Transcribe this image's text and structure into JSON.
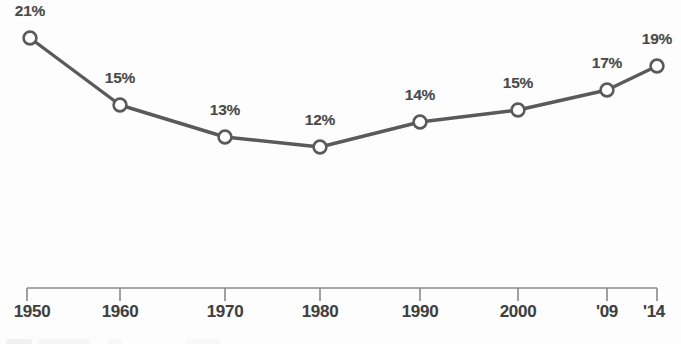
{
  "chart_data": {
    "type": "line",
    "title": "",
    "subtitle": "",
    "xlabel": "",
    "ylabel": "",
    "grid": false,
    "legend": "none",
    "series_name": "Percent",
    "categories": [
      "1950",
      "1960",
      "1970",
      "1980",
      "1990",
      "2000",
      "'09",
      "'14"
    ],
    "values": [
      21,
      15,
      13,
      12,
      14,
      15,
      17,
      19
    ],
    "value_labels": [
      "21%",
      "15%",
      "13%",
      "12%",
      "14%",
      "15%",
      "17%",
      "19%"
    ],
    "tick_labels": [
      "1950",
      "1960",
      "1970",
      "1980",
      "1990",
      "2000",
      "'09",
      "'14"
    ],
    "ylim": [
      0,
      24
    ],
    "unit": "%",
    "marker": "open-circle",
    "colors": {
      "line": "#5a5a5a",
      "marker_stroke": "#5a5a5a",
      "marker_fill": "#ffffff",
      "axis": "#8a8a8a",
      "value_text": "#4a4a4a",
      "tick_text": "#3f3f3f",
      "background": "#fdfdfd"
    },
    "geometry": {
      "point_x": [
        30,
        120,
        225,
        320,
        420,
        518,
        607,
        657
      ],
      "point_y": [
        38,
        105,
        137,
        147,
        122,
        110,
        90,
        66
      ],
      "tick_x": [
        27,
        120,
        225,
        320,
        420,
        518,
        607,
        657
      ],
      "axis_y": 288,
      "axis_left": 27,
      "axis_right": 657,
      "tick_length": 13,
      "label_offset_y": 25
    }
  }
}
